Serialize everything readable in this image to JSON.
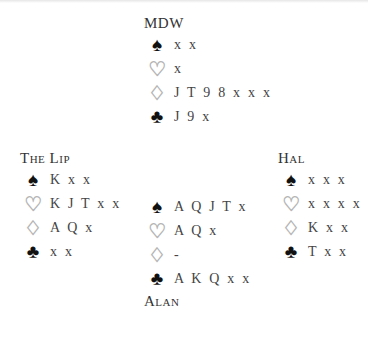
{
  "deal": {
    "north": {
      "player": "MDW",
      "spades": "x x",
      "hearts": "x",
      "diamonds": "J T 9 8 x x x",
      "clubs": "J 9 x"
    },
    "west": {
      "player": "The Lip",
      "spades": "K x x",
      "hearts": "K J T x x",
      "diamonds": "A Q x",
      "clubs": "x x"
    },
    "east": {
      "player": "Hal",
      "spades": "x x x",
      "hearts": "x x x x",
      "diamonds": "K x x",
      "clubs": "T x x"
    },
    "south": {
      "player": "Alan",
      "spades": "A Q J T x",
      "hearts": "A Q x",
      "diamonds": "-",
      "clubs": "A K Q x x"
    }
  },
  "suits": {
    "spades": "♠",
    "hearts": "♡",
    "diamonds": "♢",
    "clubs": "♣"
  }
}
